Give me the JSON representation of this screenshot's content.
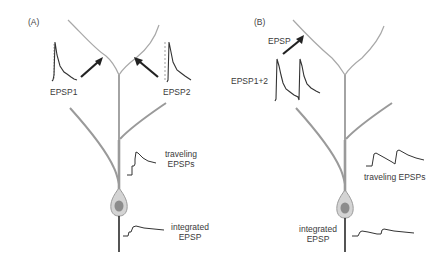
{
  "panels": {
    "a": {
      "label": "(A)",
      "epsp1_label": "EPSP1",
      "epsp2_label": "EPSP2",
      "traveling_label_line1": "traveling",
      "traveling_label_line2": "EPSPs",
      "integrated_label_line1": "integrated",
      "integrated_label_line2": "EPSP"
    },
    "b": {
      "label": "(B)",
      "epsp_label": "EPSP",
      "epsp12_label": "EPSP1+2",
      "traveling_label": "traveling EPSPs",
      "integrated_label_line1": "integrated",
      "integrated_label_line2": "EPSP"
    }
  },
  "colors": {
    "dendrite": "#9a9a9a",
    "dendrite_thin": "#a8a8a8",
    "axon": "#2a2a2a",
    "trace": "#333333",
    "synapse": "#222222",
    "soma_outer": "#cfcfcf",
    "soma_nucleus": "#8c8c8c",
    "text": "#3a3a3a"
  }
}
